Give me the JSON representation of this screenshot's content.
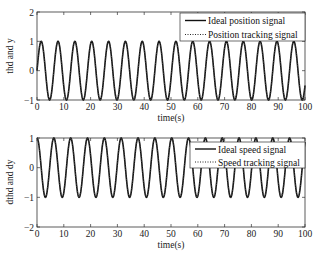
{
  "chart_data": [
    {
      "type": "line",
      "title": "",
      "xlabel": "time(s)",
      "ylabel": "thd and y",
      "xlim": [
        0,
        100
      ],
      "ylim": [
        -1,
        2
      ],
      "xticks": [
        0,
        10,
        20,
        30,
        40,
        50,
        60,
        70,
        80,
        90,
        100
      ],
      "yticks": [
        -1,
        0,
        1,
        2
      ],
      "grid": false,
      "legend_position": "upper right",
      "series": [
        {
          "name": "Ideal position signal",
          "function": "sin(t)",
          "style": "solid",
          "color": "#000000"
        },
        {
          "name": "Position tracking signal",
          "function": "sin(t) (tracks ideal)",
          "style": "dotted",
          "color": "#000000"
        }
      ]
    },
    {
      "type": "line",
      "title": "",
      "xlabel": "time(s)",
      "ylabel": "dthd and dy",
      "xlim": [
        0,
        100
      ],
      "ylim": [
        -2,
        1
      ],
      "xticks": [
        0,
        10,
        20,
        30,
        40,
        50,
        60,
        70,
        80,
        90,
        100
      ],
      "yticks": [
        -2,
        -1,
        0,
        1
      ],
      "grid": false,
      "legend_position": "upper right",
      "series": [
        {
          "name": "Ideal speed signal",
          "function": "cos(t)",
          "style": "solid",
          "color": "#000000"
        },
        {
          "name": "Speed tracking signal",
          "function": "cos(t) (tracks ideal)",
          "style": "dotted",
          "color": "#000000"
        }
      ]
    }
  ],
  "plots": [
    {
      "ylabel": "thd and y",
      "xlabel": "time(s)",
      "legend": [
        "Ideal position signal",
        "Position tracking signal"
      ]
    },
    {
      "ylabel": "dthd and dy",
      "xlabel": "time(s)",
      "legend": [
        "Ideal speed signal",
        "Speed tracking signal"
      ]
    }
  ]
}
